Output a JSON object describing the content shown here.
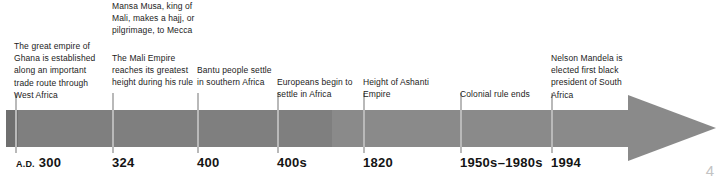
{
  "figure": {
    "name": "africa-history-timeline",
    "page_number": "4",
    "colors": {
      "bar": "#8a8a8a",
      "bar_shade": "#7f7f7f",
      "bar_cap": "#6f6f6f",
      "tick": "#b9b9b9",
      "text": "#1c1c1c",
      "page_number": "#c3c3c3"
    }
  },
  "events": [
    {
      "id": "ad-300",
      "note": "The great empire of Ghana is established along an important trade route through West Africa",
      "date_era": "A.D.",
      "date": "300",
      "tick_x": 15,
      "note_x": 14,
      "note_y": 40,
      "note_w": 92,
      "date_x": 16
    },
    {
      "id": "324-mansa-musa",
      "note": "Mansa Musa, king of Mali, makes a hajj, or pilgrimage, to Mecca",
      "date_era": "",
      "date": "324",
      "tick_x": 112,
      "note_x": 112,
      "note_y": 0,
      "note_w": 84,
      "date_x": 112
    },
    {
      "id": "324-mali-empire",
      "note": "The Mali Empire reaches its greatest height during his rule",
      "date_era": "",
      "date": "",
      "tick_x": -1,
      "note_x": 112,
      "note_y": 52,
      "note_w": 84,
      "date_x": 0
    },
    {
      "id": "400-bantu",
      "note": "Bantu people settle in southern Africa",
      "date_era": "",
      "date": "400",
      "tick_x": 197,
      "note_x": 197,
      "note_y": 64,
      "note_w": 80,
      "date_x": 197
    },
    {
      "id": "400s-europeans",
      "note": "Europeans begin to settle in Africa",
      "date_era": "",
      "date": "400s",
      "tick_x": 277,
      "note_x": 277,
      "note_y": 76,
      "note_w": 84,
      "date_x": 277
    },
    {
      "id": "1820-ashanti",
      "note": "Height of Ashanti Empire",
      "date_era": "",
      "date": "1820",
      "tick_x": 363,
      "note_x": 363,
      "note_y": 76,
      "note_w": 82,
      "date_x": 363
    },
    {
      "id": "colonial-rule-ends",
      "note": "Colonial rule ends",
      "date_era": "",
      "date": "1950s–1980s",
      "tick_x": 460,
      "note_x": 460,
      "note_y": 88,
      "note_w": 86,
      "date_x": 460
    },
    {
      "id": "1994-mandela",
      "note": "Nelson Mandela is elected first black president of South Africa",
      "date_era": "",
      "date": "1994",
      "tick_x": 551,
      "note_x": 551,
      "note_y": 52,
      "note_w": 76,
      "date_x": 551
    }
  ]
}
